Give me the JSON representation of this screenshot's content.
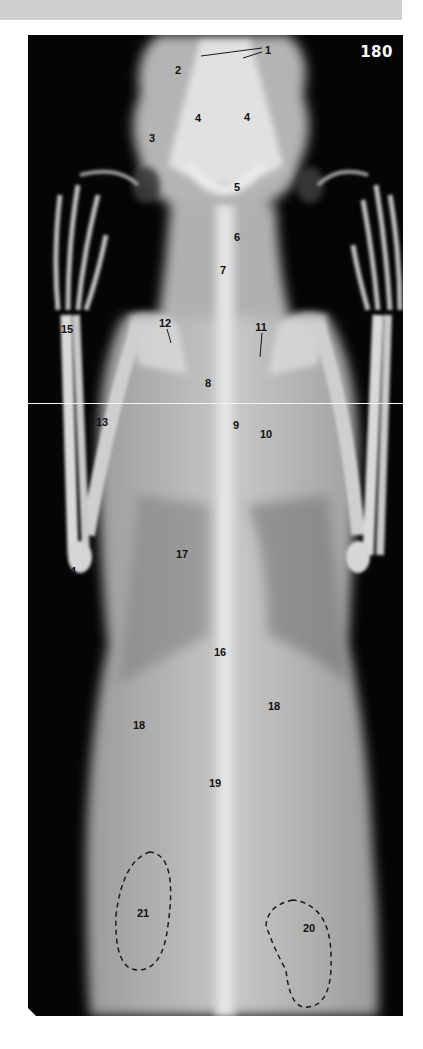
{
  "figure": {
    "number": "180",
    "colors": {
      "background": "#050505",
      "bone": "#e8e8e8",
      "soft_tissue": "#b9b9b9",
      "label_text": "#111111",
      "figure_number": "#ffffff",
      "top_bar": "#cfcfcf"
    }
  },
  "labels": [
    {
      "id": "1",
      "text": "1",
      "x": 240,
      "y": 15
    },
    {
      "id": "2",
      "text": "2",
      "x": 150,
      "y": 35
    },
    {
      "id": "3",
      "text": "3",
      "x": 124,
      "y": 103
    },
    {
      "id": "4a",
      "text": "4",
      "x": 170,
      "y": 83
    },
    {
      "id": "4b",
      "text": "4",
      "x": 219,
      "y": 82
    },
    {
      "id": "5",
      "text": "5",
      "x": 209,
      "y": 152
    },
    {
      "id": "6",
      "text": "6",
      "x": 209,
      "y": 202
    },
    {
      "id": "7",
      "text": "7",
      "x": 195,
      "y": 235
    },
    {
      "id": "8",
      "text": "8",
      "x": 180,
      "y": 348
    },
    {
      "id": "9",
      "text": "9",
      "x": 208,
      "y": 390
    },
    {
      "id": "10",
      "text": "10",
      "x": 238,
      "y": 399
    },
    {
      "id": "11",
      "text": "11",
      "x": 233,
      "y": 292
    },
    {
      "id": "12",
      "text": "12",
      "x": 137,
      "y": 288
    },
    {
      "id": "13",
      "text": "13",
      "x": 74,
      "y": 387
    },
    {
      "id": "14",
      "text": "4",
      "x": 45,
      "y": 536
    },
    {
      "id": "15",
      "text": "15",
      "x": 39,
      "y": 294
    },
    {
      "id": "16",
      "text": "16",
      "x": 192,
      "y": 617
    },
    {
      "id": "17",
      "text": "17",
      "x": 154,
      "y": 519
    },
    {
      "id": "18a",
      "text": "18",
      "x": 111,
      "y": 690
    },
    {
      "id": "18b",
      "text": "18",
      "x": 246,
      "y": 671
    },
    {
      "id": "19",
      "text": "19",
      "x": 187,
      "y": 748
    },
    {
      "id": "20",
      "text": "20",
      "x": 281,
      "y": 893
    },
    {
      "id": "21",
      "text": "21",
      "x": 115,
      "y": 878
    }
  ]
}
